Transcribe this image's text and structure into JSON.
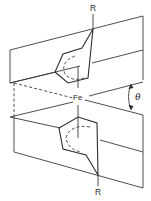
{
  "diagram": {
    "title": "",
    "labels": {
      "r_top": "R",
      "r_bottom": "R",
      "metal": "Fe",
      "angle": "θ"
    },
    "colors": {
      "line": "#3a3a3a",
      "background": "#ffffff"
    }
  }
}
